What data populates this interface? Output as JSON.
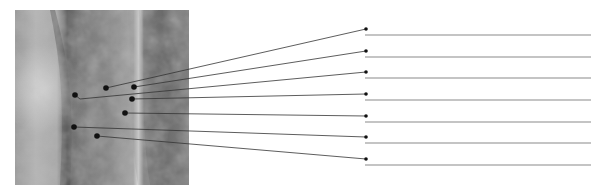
{
  "diagram": {
    "type": "labeling-worksheet",
    "image": {
      "description": "grayscale x-ray style photograph of a bone/joint",
      "x": 15,
      "y": 10,
      "width": 174,
      "height": 175
    },
    "colors": {
      "leader_line": "#333333",
      "dot": "#111111",
      "label_line": "#8a8a8a",
      "background": "#ffffff"
    },
    "callouts": [
      {
        "id": 1,
        "from": [
          106,
          88
        ],
        "to": [
          366,
          29
        ],
        "label": ""
      },
      {
        "id": 2,
        "from": [
          134,
          87
        ],
        "to": [
          366,
          51
        ],
        "label": ""
      },
      {
        "id": 3,
        "from": [
          75,
          95
        ],
        "elbow": [
          80,
          99
        ],
        "to": [
          366,
          72
        ],
        "label": ""
      },
      {
        "id": 4,
        "from": [
          132,
          99
        ],
        "to": [
          366,
          94
        ],
        "label": ""
      },
      {
        "id": 5,
        "from": [
          125,
          113
        ],
        "to": [
          366,
          116
        ],
        "label": ""
      },
      {
        "id": 6,
        "from": [
          74,
          127
        ],
        "to": [
          366,
          137
        ],
        "label": ""
      },
      {
        "id": 7,
        "from": [
          97,
          136
        ],
        "to": [
          366,
          159
        ],
        "label": ""
      }
    ],
    "label_lines": {
      "x_start": 365,
      "x_end": 591,
      "offset_below_dot": 6
    }
  }
}
